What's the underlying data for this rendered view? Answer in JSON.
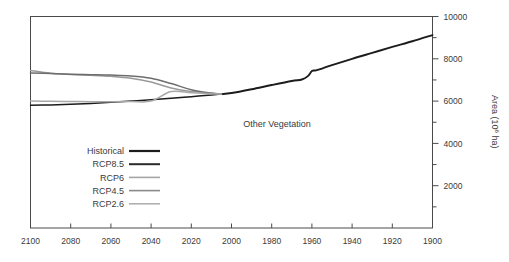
{
  "chart_data": {
    "type": "line",
    "title": "",
    "annotation": "Other Vegetation",
    "xlabel": "",
    "ylabel": "Area (10⁶ ha)",
    "ylabel_base": "Area (10",
    "ylabel_exp": "6",
    "ylabel_tail": " ha)",
    "xlim": [
      2100,
      1900
    ],
    "x_reversed": true,
    "ylim": [
      0,
      10000
    ],
    "grid": false,
    "legend_position": "lower-left-inside",
    "x_ticks": [
      2100,
      2080,
      2060,
      2040,
      2020,
      2000,
      1980,
      1960,
      1940,
      1920,
      1900
    ],
    "x_tick_labels": [
      "2100",
      "2080",
      "2060",
      "2040",
      "2020",
      "2000",
      "1980",
      "1960",
      "1940",
      "1920",
      "1900"
    ],
    "y_ticks": [
      2000,
      4000,
      6000,
      8000,
      10000
    ],
    "y_tick_labels": [
      "2000",
      "4000",
      "6000",
      "8000",
      "10000"
    ],
    "y_minor_ticks": [
      1000,
      3000,
      5000,
      7000,
      9000
    ],
    "x": [
      1900,
      1910,
      1920,
      1930,
      1940,
      1950,
      1955,
      1958,
      1960,
      1962,
      1965,
      1970,
      1980,
      1990,
      2000,
      2005
    ],
    "series": [
      {
        "name": "Historical",
        "color": "#1c1c1c",
        "width": 1.9,
        "x": [
          1900,
          1910,
          1920,
          1930,
          1940,
          1950,
          1955,
          1958,
          1960,
          1962,
          1965,
          1970,
          1980,
          1990,
          2000,
          2005
        ],
        "values": [
          9120,
          8830,
          8560,
          8280,
          8000,
          7700,
          7540,
          7450,
          7420,
          7180,
          7020,
          6950,
          6760,
          6560,
          6380,
          6330
        ]
      },
      {
        "name": "RCP8.5",
        "color": "#1c1c1c",
        "width": 1.5,
        "x": [
          2005,
          2010,
          2020,
          2030,
          2040,
          2050,
          2060,
          2070,
          2080,
          2090,
          2100
        ],
        "values": [
          6330,
          6290,
          6210,
          6130,
          6060,
          6000,
          5940,
          5890,
          5850,
          5820,
          5800
        ]
      },
      {
        "name": "RCP6",
        "color": "#9a9a9a",
        "width": 1.5,
        "x": [
          2005,
          2010,
          2020,
          2030,
          2040,
          2050,
          2060,
          2070,
          2080,
          2090,
          2100
        ],
        "values": [
          6330,
          6360,
          6450,
          6620,
          6900,
          7080,
          7170,
          7220,
          7260,
          7320,
          7450
        ]
      },
      {
        "name": "RCP4.5",
        "color": "#6e6e6e",
        "width": 1.5,
        "x": [
          2005,
          2010,
          2020,
          2030,
          2040,
          2050,
          2060,
          2070,
          2080,
          2090,
          2100
        ],
        "values": [
          6330,
          6380,
          6540,
          6830,
          7080,
          7190,
          7230,
          7250,
          7270,
          7300,
          7330
        ]
      },
      {
        "name": "RCP2.6",
        "color": "#a8a8a8",
        "width": 1.5,
        "x": [
          2005,
          2010,
          2020,
          2030,
          2040,
          2050,
          2060,
          2070,
          2080,
          2090,
          2100
        ],
        "values": [
          6330,
          6350,
          6400,
          6450,
          6000,
          5980,
          5970,
          5970,
          5980,
          5990,
          6010
        ]
      }
    ],
    "legend": [
      {
        "label": "Historical",
        "color": "#1c1c1c",
        "width": 2.2
      },
      {
        "label": "RCP8.5",
        "color": "#2a2a2a",
        "width": 2.0
      },
      {
        "label": "RCP6",
        "color": "#a5a5a5",
        "width": 1.6
      },
      {
        "label": "RCP4.5",
        "color": "#8a8a8a",
        "width": 1.6
      },
      {
        "label": "RCP2.6",
        "color": "#b0b0b0",
        "width": 1.6
      }
    ]
  }
}
